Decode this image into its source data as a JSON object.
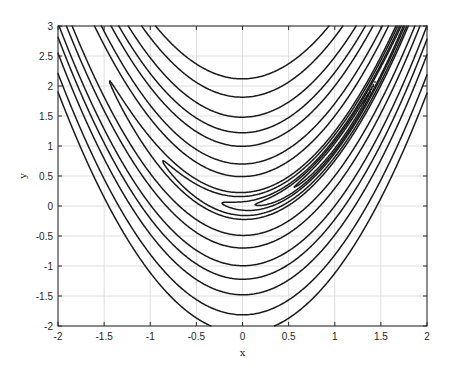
{
  "chart_data": {
    "type": "contour",
    "title": "",
    "xlabel": "x",
    "ylabel": "y",
    "xlim": [
      -2,
      2
    ],
    "ylim": [
      -2,
      3
    ],
    "grid": true,
    "legend": null,
    "function": "f(x,y) = 100*(y - x^2)^2 + (1 - x)^2",
    "levels": [
      0.2,
      0.75,
      1.5,
      3.5,
      6,
      25,
      50,
      100,
      150,
      220,
      330,
      450
    ],
    "xticks": [
      -2,
      -1.5,
      -1,
      -0.5,
      0,
      0.5,
      1,
      1.5,
      2
    ],
    "xtick_labels": [
      "-2",
      "-1.5",
      "-1",
      "-0.5",
      "0",
      "0.5",
      "1",
      "1.5",
      "2"
    ],
    "yticks": [
      -2,
      -1.5,
      -1,
      -0.5,
      0,
      0.5,
      1,
      1.5,
      2,
      2.5,
      3
    ],
    "ytick_labels": [
      "-2",
      "-1.5",
      "-1",
      "-0.5",
      "0",
      "0.5",
      "1",
      "1.5",
      "2",
      "2.5",
      "3"
    ],
    "line_color": "#1a1a1a",
    "grid_color": "#dedede",
    "axes_color": "#262626"
  }
}
